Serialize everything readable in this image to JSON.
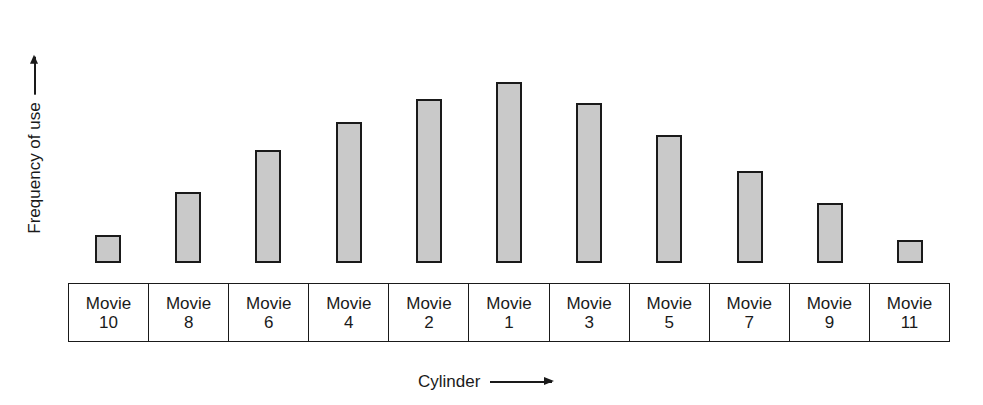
{
  "chart_data": {
    "type": "bar",
    "title": "",
    "xlabel": "Cylinder",
    "ylabel": "Frequency of use",
    "categories": [
      "Movie 10",
      "Movie 8",
      "Movie 6",
      "Movie 4",
      "Movie 2",
      "Movie 1",
      "Movie 3",
      "Movie 5",
      "Movie 7",
      "Movie 9",
      "Movie 11"
    ],
    "values": [
      28,
      71,
      113,
      141,
      164,
      181,
      160,
      128,
      92,
      60,
      23
    ],
    "value_units": "relative bar height (px, unlabeled axis)",
    "ylim": [
      0,
      203
    ],
    "grid": false,
    "legend": null
  },
  "axis": {
    "y_label": "Frequency of use",
    "x_label": "Cylinder"
  },
  "cells": [
    {
      "line1": "Movie",
      "line2": "10",
      "height": 28
    },
    {
      "line1": "Movie",
      "line2": "8",
      "height": 71
    },
    {
      "line1": "Movie",
      "line2": "6",
      "height": 113
    },
    {
      "line1": "Movie",
      "line2": "4",
      "height": 141
    },
    {
      "line1": "Movie",
      "line2": "2",
      "height": 164
    },
    {
      "line1": "Movie",
      "line2": "1",
      "height": 181
    },
    {
      "line1": "Movie",
      "line2": "3",
      "height": 160
    },
    {
      "line1": "Movie",
      "line2": "5",
      "height": 128
    },
    {
      "line1": "Movie",
      "line2": "7",
      "height": 92
    },
    {
      "line1": "Movie",
      "line2": "9",
      "height": 60
    },
    {
      "line1": "Movie",
      "line2": "11",
      "height": 23
    }
  ],
  "colors": {
    "bar_fill": "#c9c9c9",
    "stroke": "#1a1a1a",
    "background": "#ffffff"
  }
}
